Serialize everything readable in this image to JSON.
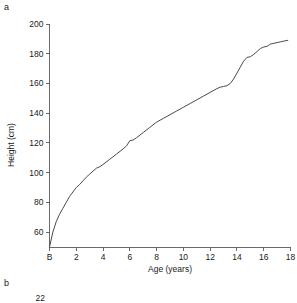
{
  "figure": {
    "panel_a_label": "a",
    "panel_b_label": "b"
  },
  "chart_data": {
    "type": "line",
    "title": "",
    "xlabel": "Age (years)",
    "ylabel": "Height (cm)",
    "xlim": [
      0,
      18
    ],
    "ylim": [
      50,
      200
    ],
    "grid": false,
    "legend": null,
    "x_tick_labels": [
      "B",
      "2",
      "4",
      "6",
      "8",
      "10",
      "12",
      "14",
      "16",
      "18"
    ],
    "x_tick_values": [
      0,
      2,
      4,
      6,
      8,
      10,
      12,
      14,
      16,
      18
    ],
    "y_tick_labels": [
      "60",
      "80",
      "100",
      "120",
      "140",
      "160",
      "180",
      "200"
    ],
    "y_tick_values": [
      60,
      80,
      100,
      120,
      140,
      160,
      180,
      200
    ],
    "series": [
      {
        "name": "Height-for-age (distance curve)",
        "x": [
          0,
          0.25,
          0.5,
          0.75,
          1,
          1.25,
          1.5,
          1.75,
          2,
          2.25,
          2.5,
          2.75,
          3,
          3.25,
          3.5,
          3.75,
          4,
          4.5,
          5,
          5.5,
          5.75,
          6,
          6.25,
          6.5,
          7,
          7.5,
          8,
          8.5,
          9,
          9.5,
          10,
          10.5,
          11,
          11.5,
          12,
          12.5,
          12.75,
          13,
          13.25,
          13.5,
          13.75,
          14,
          14.25,
          14.5,
          14.75,
          15,
          15.25,
          15.5,
          15.75,
          16,
          16.25,
          16.5,
          16.75,
          17,
          17.25,
          17.5,
          17.8
        ],
        "y": [
          50,
          60,
          67,
          72,
          76,
          80,
          84,
          87,
          90,
          92,
          94.5,
          97,
          99,
          101,
          103,
          104,
          105.5,
          109,
          112.5,
          116,
          118,
          121.5,
          122,
          123.5,
          127,
          130.5,
          134,
          136.5,
          139,
          141.5,
          144,
          146.5,
          149,
          151.5,
          154,
          156.5,
          157.5,
          158,
          158.5,
          160,
          163,
          167,
          171,
          175,
          177.5,
          178,
          179.5,
          181.5,
          183.5,
          184.5,
          185,
          186.5,
          187,
          187.5,
          188,
          188.5,
          189
        ]
      }
    ]
  },
  "panel_b": {
    "partial_y_tick_label": "22"
  }
}
